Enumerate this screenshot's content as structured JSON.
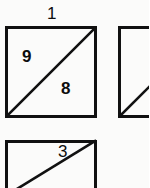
{
  "figure": {
    "kind": "numbered-squares-diagram",
    "background_color": "#fbfbfa",
    "stroke_color": "#111111",
    "text_color": "#0d0d0d",
    "width": 149,
    "height": 188,
    "squares": [
      {
        "id": "square-1",
        "label": "1",
        "label_position": "above-top-edge",
        "label_x": 47,
        "label_y": 5,
        "x": 5,
        "y": 26,
        "size": 92,
        "clipped": "none",
        "diagonal": "bottom-left-to-top-right",
        "digits": [
          {
            "value": "9",
            "region": "upper-left-triangle",
            "x": 22,
            "y": 48
          },
          {
            "value": "8",
            "region": "lower-right-triangle",
            "x": 61,
            "y": 80
          }
        ]
      },
      {
        "id": "square-2",
        "label": "",
        "label_position": "",
        "label_x": 0,
        "label_y": 0,
        "x": 118,
        "y": 26,
        "size": 92,
        "clipped": "right-edge",
        "diagonal": "bottom-left-to-top-right",
        "digits": []
      },
      {
        "id": "square-3",
        "label": "3",
        "label_position": "inside-upper-left",
        "label_x": 58,
        "label_y": 143,
        "x": 5,
        "y": 140,
        "size": 92,
        "clipped": "bottom-edge",
        "diagonal": "bottom-left-to-top-right",
        "digits": []
      }
    ],
    "stroke_widths": {
      "border": 3.0,
      "diagonal": 2.6
    }
  }
}
